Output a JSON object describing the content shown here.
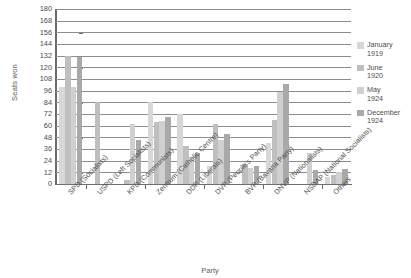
{
  "chart_data": {
    "type": "bar",
    "title": "",
    "xlabel": "Party",
    "ylabel": "Seats won",
    "ylim": [
      0,
      180
    ],
    "ytick_step": 12,
    "yticks": [
      180,
      168,
      156,
      144,
      132,
      120,
      108,
      96,
      84,
      72,
      60,
      48,
      36,
      24,
      12,
      0
    ],
    "grid": true,
    "legend_position": "right",
    "categories": [
      "SPD (Socialists)",
      "USPD (Left Socialists)",
      "KPD (Communists)",
      "Zentrum (Catholic Centre)",
      "DDP (Liberals)",
      "DVP (People's Party)",
      "BVP (Bavaria Party)",
      "DNVP (Nationalists)",
      "NSDAP (National Socialists)",
      "Others"
    ],
    "series": [
      {
        "name": "January 1919",
        "color": "#d7d7d7",
        "values": [
          100,
          0,
          0,
          84,
          72,
          19,
          0,
          42,
          0,
          7
        ]
      },
      {
        "name": "June 1920",
        "color": "#bfbfbf",
        "values": [
          132,
          84,
          4,
          64,
          39,
          62,
          21,
          66,
          0,
          9
        ]
      },
      {
        "name": "May 1924",
        "color": "#d0d0d0",
        "values": [
          100,
          0,
          62,
          65,
          28,
          45,
          16,
          95,
          32,
          12
        ]
      },
      {
        "name": "December 1924",
        "color": "#a9a9a9",
        "values": [
          131,
          0,
          45,
          69,
          32,
          51,
          19,
          103,
          14,
          15
        ]
      }
    ]
  },
  "legend": {
    "items": [
      {
        "label_line1": "January",
        "label_line2": "1919",
        "color": "#d7d7d7"
      },
      {
        "label_line1": "June",
        "label_line2": "1920",
        "color": "#bfbfbf"
      },
      {
        "label_line1": "May",
        "label_line2": "1924",
        "color": "#d0d0d0"
      },
      {
        "label_line1": "December",
        "label_line2": "1924",
        "color": "#a9a9a9"
      }
    ]
  }
}
